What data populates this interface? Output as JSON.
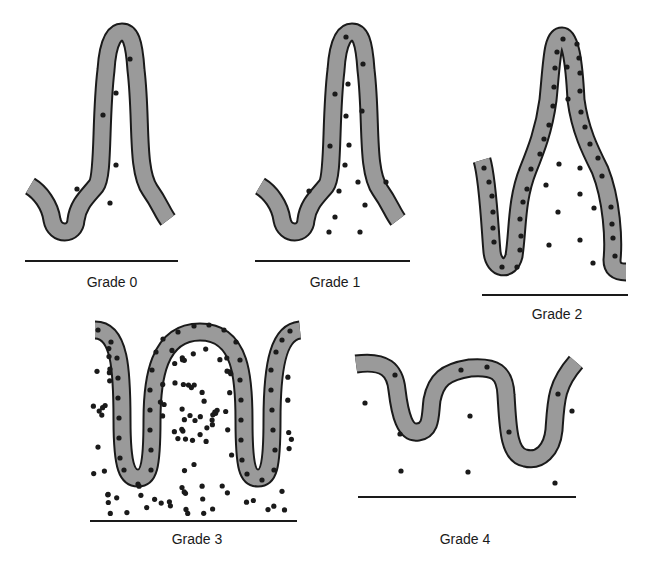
{
  "figure": {
    "colors": {
      "epithelium_fill": "#9a9a9a",
      "outline": "#1a1a1a",
      "cells": "#1a1a1a",
      "background": "#ffffff"
    },
    "panels": [
      {
        "id": "grade-0",
        "label": "Grade 0",
        "description": "Normal villus; few scattered inflammatory cells"
      },
      {
        "id": "grade-1",
        "label": "Grade 1",
        "description": "Mild increase in lamina propria cells"
      },
      {
        "id": "grade-2",
        "label": "Grade 2",
        "description": "Increased intraepithelial and lamina propria cells"
      },
      {
        "id": "grade-3",
        "label": "Grade 3",
        "description": "Dense infiltrate with villous broadening"
      },
      {
        "id": "grade-4",
        "label": "Grade 4",
        "description": "Flattened mucosa, sparse cells"
      }
    ]
  }
}
